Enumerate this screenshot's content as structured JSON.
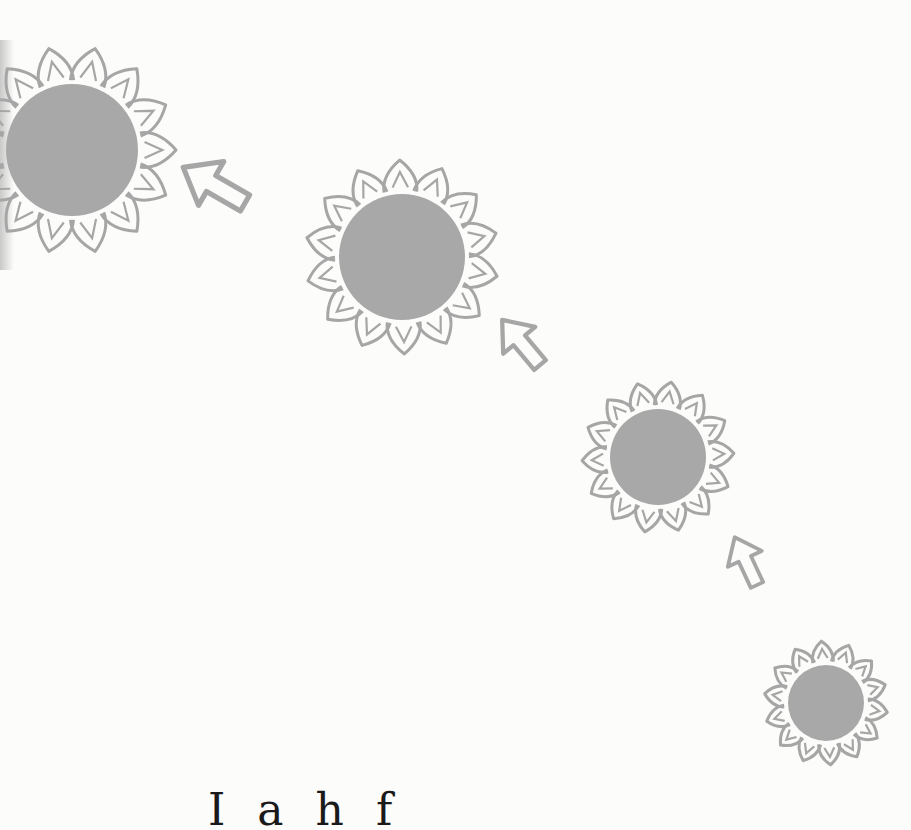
{
  "illustration": {
    "description": "Four stylized suns decreasing in size along a diagonal, linked by outline arrows pointing up-left",
    "colors": {
      "background": "#fcfcfb",
      "sun_fill": "#a8a8a8",
      "outline": "#a6a6a6"
    },
    "suns": [
      {
        "cx": 72,
        "cy": 150,
        "r": 66,
        "rays": 14,
        "ray_len": 38
      },
      {
        "cx": 402,
        "cy": 257,
        "r": 63,
        "rays": 14,
        "ray_len": 34
      },
      {
        "cx": 658,
        "cy": 457,
        "r": 48,
        "rays": 14,
        "ray_len": 28
      },
      {
        "cx": 826,
        "cy": 703,
        "r": 38,
        "rays": 14,
        "ray_len": 24
      }
    ],
    "arrows": [
      {
        "x": 245,
        "y": 203,
        "angle": -150,
        "scale": 1.15
      },
      {
        "x": 540,
        "y": 365,
        "angle": -130,
        "scale": 0.95
      },
      {
        "x": 757,
        "y": 585,
        "angle": -115,
        "scale": 0.85
      }
    ]
  },
  "caption": {
    "text": "I  a  h  f",
    "note": "Text line truncated at bottom edge; only top portions of letters visible"
  }
}
